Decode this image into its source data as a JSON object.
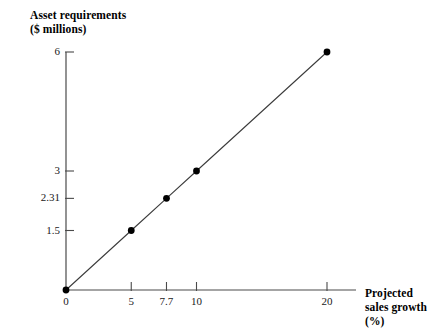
{
  "chart_data": {
    "type": "line",
    "title": "",
    "ylabel": "Asset requirements\n($ millions)",
    "xlabel": "Projected\nsales growth (%)",
    "x": [
      0,
      5,
      7.7,
      10,
      20
    ],
    "values": [
      0,
      1.5,
      2.31,
      3,
      6
    ],
    "series": [
      {
        "name": "Asset requirements",
        "values": [
          0,
          1.5,
          2.31,
          3,
          6
        ]
      }
    ],
    "xtick_labels": [
      "0",
      "5",
      "7.7",
      "10",
      "20"
    ],
    "xtick_values": [
      0,
      5,
      7.7,
      10,
      20
    ],
    "ytick_labels": [
      "1.5",
      "2.31",
      "3",
      "6"
    ],
    "ytick_values": [
      1.5,
      2.31,
      3,
      6
    ],
    "xlim": [
      0,
      21.5
    ],
    "ylim": [
      0,
      6.35
    ],
    "grid": false,
    "legend": false,
    "marker": "filled-circle",
    "line_color": "#3b3b3b",
    "marker_color": "#000000",
    "axis_color": "#4a4a4a",
    "background_color": "#ffffff"
  },
  "axes": {
    "y_title": "Asset requirements\n($ millions)",
    "x_title": "Projected\nsales growth (%)"
  },
  "ticks": {
    "y": [
      {
        "label": "6",
        "value": 6
      },
      {
        "label": "3",
        "value": 3
      },
      {
        "label": "2.31",
        "value": 2.31
      },
      {
        "label": "1.5",
        "value": 1.5
      }
    ],
    "x": [
      {
        "label": "0",
        "value": 0
      },
      {
        "label": "5",
        "value": 5
      },
      {
        "label": "7.7",
        "value": 7.7
      },
      {
        "label": "10",
        "value": 10
      },
      {
        "label": "20",
        "value": 20
      }
    ]
  }
}
